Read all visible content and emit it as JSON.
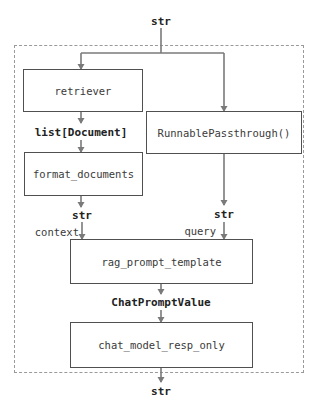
{
  "diagram": {
    "type": "flow",
    "container": {
      "style": "dashed"
    },
    "input_type": "str",
    "output_type": "str",
    "nodes": [
      {
        "id": "retriever",
        "label": "retriever"
      },
      {
        "id": "passthrough",
        "label": "RunnablePassthrough()"
      },
      {
        "id": "format_documents",
        "label": "format_documents"
      },
      {
        "id": "rag_prompt_template",
        "label": "rag_prompt_template"
      },
      {
        "id": "chat_model_resp_only",
        "label": "chat_model_resp_only"
      }
    ],
    "edge_labels": {
      "input": "str",
      "retriever_out": "list[Document]",
      "format_out": "str",
      "passthrough_out": "str",
      "context_key": "context",
      "query_key": "query",
      "prompt_out": "ChatPromptValue",
      "output": "str"
    },
    "edges": [
      {
        "from": "input",
        "to": "retriever"
      },
      {
        "from": "input",
        "to": "passthrough"
      },
      {
        "from": "retriever",
        "to": "format_documents",
        "label": "list[Document]"
      },
      {
        "from": "format_documents",
        "to": "rag_prompt_template",
        "label": "str",
        "key": "context"
      },
      {
        "from": "passthrough",
        "to": "rag_prompt_template",
        "label": "str",
        "key": "query"
      },
      {
        "from": "rag_prompt_template",
        "to": "chat_model_resp_only",
        "label": "ChatPromptValue"
      },
      {
        "from": "chat_model_resp_only",
        "to": "output",
        "label": "str"
      }
    ],
    "colors": {
      "wire": "#7a7a7a",
      "box_border": "#505050",
      "frame": "#9a9a9a",
      "text": "#222222"
    }
  }
}
